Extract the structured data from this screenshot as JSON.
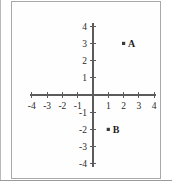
{
  "figure": {
    "title": "",
    "background_color": "#ffffff",
    "frame_color": "#a8a8a8",
    "axis_color": "#5b5b5b"
  },
  "chart_data": {
    "type": "scatter",
    "title": "",
    "xlabel": "",
    "ylabel": "",
    "xlim": [
      -4,
      4
    ],
    "ylim": [
      -4,
      4
    ],
    "grid": false,
    "legend": "none",
    "x_tick_labels": [
      "-4",
      "-3",
      "-2",
      "-1",
      "1",
      "2",
      "3",
      "4"
    ],
    "x_tick_values": [
      -4,
      -3,
      -2,
      -1,
      1,
      2,
      3,
      4
    ],
    "y_tick_labels": [
      "4",
      "3",
      "2",
      "1",
      "-1",
      "-2",
      "-3",
      "-4"
    ],
    "y_tick_values": [
      4,
      3,
      2,
      1,
      -1,
      -2,
      -3,
      -4
    ],
    "points": [
      {
        "label": "A",
        "x": 2,
        "y": 3
      },
      {
        "label": "B",
        "x": 1,
        "y": -2
      }
    ]
  }
}
